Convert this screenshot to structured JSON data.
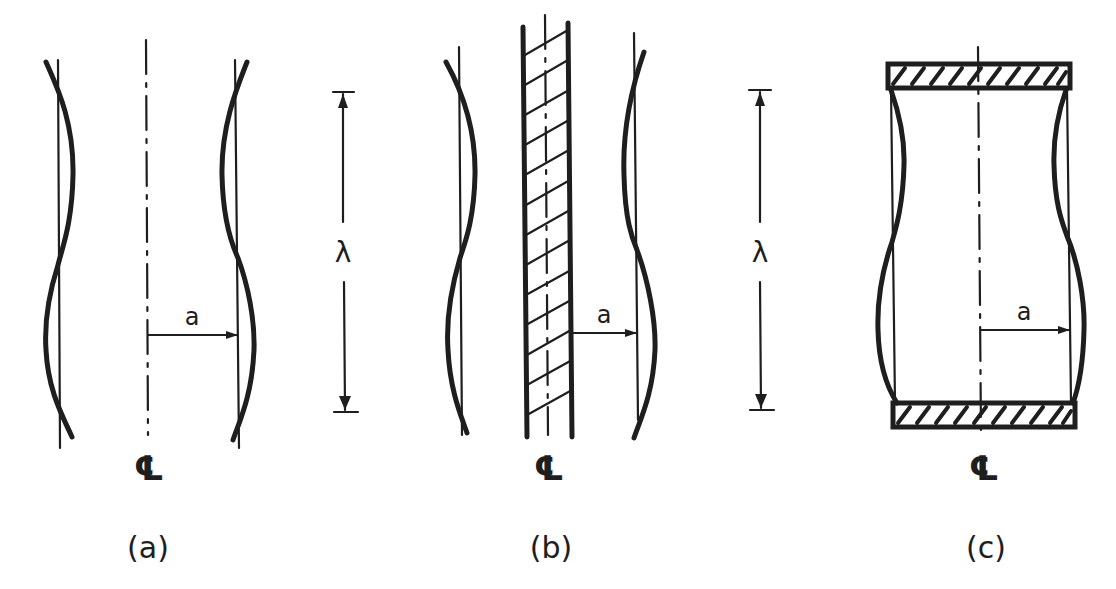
{
  "figure": {
    "panels": [
      {
        "id": "a",
        "caption": "(a)",
        "radius_label": "a",
        "centerline_symbol": "℄",
        "wavelength_label": "λ",
        "description": "Free liquid jet with varicose perturbation of wavelength λ about radius a"
      },
      {
        "id": "b",
        "caption": "(b)",
        "radius_label": "a",
        "centerline_symbol": "℄",
        "wavelength_label": "λ",
        "description": "Liquid annulus around a solid hatched core of radius a"
      },
      {
        "id": "c",
        "caption": "(c)",
        "radius_label": "a",
        "centerline_symbol": "℄",
        "description": "Liquid column of radius a bridged between two hatched end plates"
      }
    ],
    "colors": {
      "ink": "#1e1e1e",
      "background": "#ffffff"
    }
  }
}
